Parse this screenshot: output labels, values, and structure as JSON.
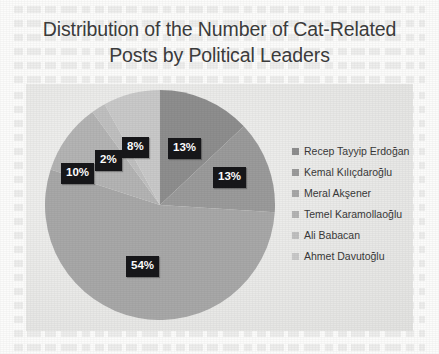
{
  "chart_data": {
    "type": "pie",
    "title": "Distribution of the Number of Cat-Related Posts by Political Leaders",
    "title_line1": "Distribution of the Number of Cat-Related",
    "title_line2": "Posts by Political Leaders",
    "categories": [
      "Recep Tayyip Erdoğan",
      "Kemal Kılıçdaroğlu",
      "Meral Akşener",
      "Temel Karamollaoğlu",
      "Ali Babacan",
      "Ahmet Davutoğlu"
    ],
    "values": [
      13,
      13,
      54,
      10,
      2,
      8
    ],
    "value_labels": [
      "13%",
      "13%",
      "54%",
      "10%",
      "2%",
      "8%"
    ],
    "colors": [
      "#8e8e8e",
      "#9b9b9b",
      "#a8a8a8",
      "#b4b4b4",
      "#c0c0c0",
      "#c9c9c9"
    ],
    "units": "percent",
    "legend_position": "right",
    "grid": false,
    "xlabel": "",
    "ylabel": ""
  },
  "labels": [
    {
      "text": "13%",
      "left": 168,
      "top": 138
    },
    {
      "text": "13%",
      "left": 213,
      "top": 167
    },
    {
      "text": "54%",
      "left": 126,
      "top": 256
    },
    {
      "text": "10%",
      "left": 61,
      "top": 163
    },
    {
      "text": "2%",
      "left": 95,
      "top": 150
    },
    {
      "text": "8%",
      "left": 122,
      "top": 137
    }
  ],
  "legend": {
    "items": [
      {
        "label": "Recep Tayyip Erdoğan",
        "color": "#8e8e8e"
      },
      {
        "label": "Kemal Kılıçdaroğlu",
        "color": "#9b9b9b"
      },
      {
        "label": "Meral Akşener",
        "color": "#a8a8a8"
      },
      {
        "label": "Temel Karamollaoğlu",
        "color": "#b4b4b4"
      },
      {
        "label": "Ali Babacan",
        "color": "#c0c0c0"
      },
      {
        "label": "Ahmet Davutoğlu",
        "color": "#c9c9c9"
      }
    ]
  },
  "style": {
    "panel_background": "#ebebe9",
    "page_background": "#fcfcfb",
    "title_color": "#3d3d3d",
    "label_background": "#17171a",
    "label_color": "#ffffff"
  }
}
